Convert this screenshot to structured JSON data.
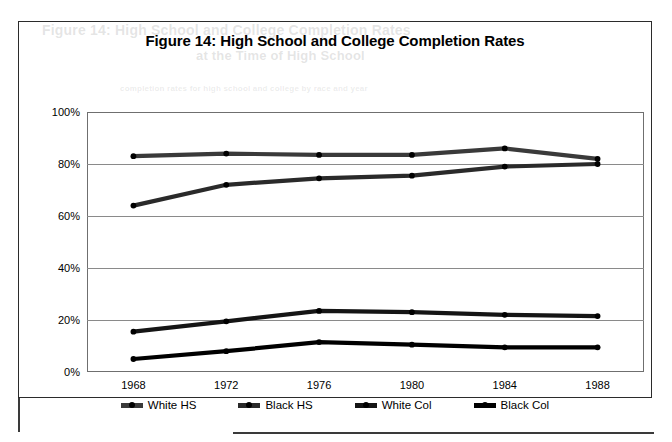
{
  "figure": {
    "title": "Figure 14: High School and College Completion Rates",
    "bleed_text_1": "Figure 14: High School and College Completion Rates",
    "bleed_text_2": "at the Time of High School",
    "bleed_text_3": "completion rates for high school and college by race and year"
  },
  "chart_data": {
    "type": "line",
    "title": "Figure 14: High School and College Completion Rates",
    "xlabel": "",
    "ylabel": "",
    "x": [
      1968,
      1972,
      1976,
      1980,
      1984,
      1988
    ],
    "categories": [
      "1968",
      "1972",
      "1976",
      "1980",
      "1984",
      "1988"
    ],
    "xtick_labels": [
      "1968",
      "1972",
      "1976",
      "1980",
      "1984",
      "1988"
    ],
    "ytick_labels": [
      "0%",
      "20%",
      "40%",
      "60%",
      "80%",
      "100%"
    ],
    "ytick_values": [
      0,
      20,
      40,
      60,
      80,
      100
    ],
    "ylim": [
      0,
      100
    ],
    "grid": "horizontal",
    "legend_position": "bottom",
    "series": [
      {
        "name": "White HS",
        "color": "#3a3a3a",
        "values": [
          83,
          84,
          83.5,
          83.5,
          86,
          82
        ]
      },
      {
        "name": "Black HS",
        "color": "#2a2a2a",
        "values": [
          64,
          72,
          74.5,
          75.5,
          79,
          80
        ]
      },
      {
        "name": "White Col",
        "color": "#151515",
        "values": [
          15.5,
          19.5,
          23.5,
          23,
          22,
          21.5
        ]
      },
      {
        "name": "Black Col",
        "color": "#000000",
        "values": [
          5,
          8,
          11.5,
          10.5,
          9.5,
          9.5
        ]
      }
    ]
  },
  "legend": {
    "items": [
      {
        "label": "White HS"
      },
      {
        "label": "Black HS"
      },
      {
        "label": "White Col"
      },
      {
        "label": "Black Col"
      }
    ]
  }
}
